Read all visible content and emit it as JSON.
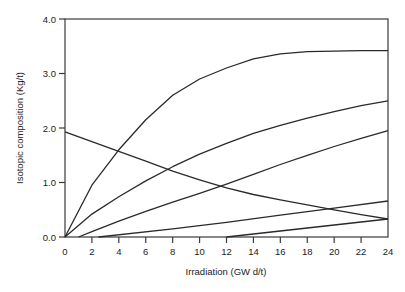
{
  "chart_data": {
    "type": "line",
    "title": "",
    "xlabel": "Irradiation (GW d/t)",
    "ylabel": "Isotopic composition (Kg/t)",
    "xlim": [
      0,
      24
    ],
    "ylim": [
      0,
      4
    ],
    "x_ticks": [
      0,
      2,
      4,
      6,
      8,
      10,
      12,
      14,
      16,
      18,
      20,
      22,
      24
    ],
    "y_ticks": [
      0,
      1,
      2,
      3,
      4
    ],
    "y_tick_labels": [
      "0.0",
      "1.0",
      "2.0",
      "3.0",
      "4.0"
    ],
    "grid": false,
    "legend": null,
    "series": [
      {
        "name": "curve-1",
        "x": [
          0,
          2,
          4,
          6,
          8,
          10,
          12,
          14,
          16,
          18,
          20,
          22,
          24
        ],
        "y": [
          0,
          0.95,
          1.6,
          2.15,
          2.6,
          2.9,
          3.1,
          3.27,
          3.36,
          3.4,
          3.41,
          3.42,
          3.42
        ]
      },
      {
        "name": "curve-2",
        "x": [
          0,
          2,
          4,
          6,
          8,
          10,
          12,
          14,
          16,
          18,
          20,
          22,
          24
        ],
        "y": [
          0,
          0.42,
          0.74,
          1.03,
          1.29,
          1.52,
          1.72,
          1.9,
          2.05,
          2.18,
          2.3,
          2.41,
          2.5
        ]
      },
      {
        "name": "curve-3",
        "x": [
          1,
          2,
          4,
          6,
          8,
          10,
          12,
          14,
          16,
          18,
          20,
          22,
          24
        ],
        "y": [
          0,
          0.1,
          0.29,
          0.47,
          0.64,
          0.8,
          0.97,
          1.15,
          1.33,
          1.5,
          1.66,
          1.81,
          1.95
        ]
      },
      {
        "name": "curve-4",
        "x": [
          2.5,
          8,
          12,
          16,
          20,
          24
        ],
        "y": [
          0,
          0.15,
          0.27,
          0.4,
          0.53,
          0.66
        ]
      },
      {
        "name": "curve-5",
        "x": [
          12,
          16,
          20,
          24
        ],
        "y": [
          0,
          0.11,
          0.22,
          0.33
        ]
      },
      {
        "name": "curve-6-declining",
        "x": [
          0,
          2,
          4,
          6,
          8,
          10,
          12,
          14,
          16,
          18,
          20,
          22,
          24
        ],
        "y": [
          1.93,
          1.75,
          1.57,
          1.39,
          1.21,
          1.05,
          0.9,
          0.78,
          0.68,
          0.59,
          0.5,
          0.41,
          0.33
        ]
      }
    ]
  },
  "axes": {
    "x_title": "Irradiation (GW d/t)",
    "y_title": "Isotopic composition (Kg/t)"
  },
  "colors": {
    "line": "#2a2a2a",
    "frame": "#3a3a3a",
    "background": "#ffffff"
  }
}
